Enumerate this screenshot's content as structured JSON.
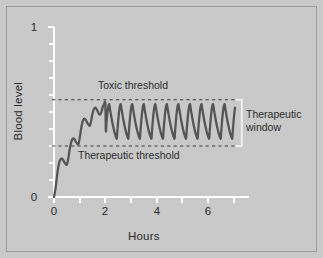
{
  "chart_data": {
    "type": "line",
    "title": "",
    "xlabel": "Hours",
    "ylabel": "Blood level",
    "xlim": [
      0,
      7.6
    ],
    "ylim": [
      0,
      1
    ],
    "grid": false,
    "legend": "none",
    "x_ticks": [
      0,
      1,
      2,
      3,
      4,
      5,
      6,
      7
    ],
    "x_tick_labels": [
      "0",
      "",
      "2",
      "",
      "4",
      "",
      "6",
      ""
    ],
    "y_ticks": [
      0,
      0.1,
      0.2,
      0.3,
      0.4,
      0.5,
      0.6,
      0.7,
      0.8,
      0.9,
      1
    ],
    "y_tick_labels": [
      "0",
      "",
      "",
      "",
      "",
      "",
      "",
      "",
      "",
      "",
      "1"
    ],
    "annotations": [
      {
        "text": "Toxic threshold",
        "x": 1.7,
        "y": 0.69
      },
      {
        "text": "Therapeutic threshold",
        "x": 1.0,
        "y": 0.255
      },
      {
        "text": "Therapeutic window",
        "x": 7.6,
        "y": 0.43
      }
    ],
    "reference_lines": [
      {
        "name": "toxic_threshold",
        "y": 0.572,
        "style": "dashed",
        "color": "#3a3a3a"
      },
      {
        "name": "therapeutic_threshold",
        "y": 0.3,
        "style": "dashed",
        "color": "#3a3a3a"
      }
    ],
    "series": [
      {
        "name": "blood level",
        "color": "#555555",
        "description": "Drug concentration rising to steady state then oscillating between therapeutic and toxic thresholds with repeated dosing",
        "x": [
          0.0,
          0.05,
          0.1,
          0.15,
          0.2,
          0.25,
          0.3,
          0.35,
          0.4,
          0.45,
          0.5,
          0.55,
          0.6,
          0.65,
          0.7,
          0.75,
          0.8,
          0.85,
          0.9,
          0.95,
          1.0,
          1.05,
          1.1,
          1.15,
          1.2,
          1.25,
          1.3,
          1.35,
          1.4,
          1.45,
          1.5,
          1.55,
          1.6,
          1.65,
          1.7,
          1.75,
          1.8,
          1.85,
          1.9,
          1.95,
          2.0
        ],
        "y": [
          0.0,
          0.04,
          0.1,
          0.16,
          0.2,
          0.22,
          0.225,
          0.22,
          0.205,
          0.195,
          0.19,
          0.22,
          0.27,
          0.31,
          0.335,
          0.345,
          0.34,
          0.325,
          0.315,
          0.31,
          0.345,
          0.395,
          0.435,
          0.455,
          0.46,
          0.45,
          0.435,
          0.425,
          0.42,
          0.45,
          0.49,
          0.515,
          0.525,
          0.52,
          0.505,
          0.49,
          0.485,
          0.5,
          0.53,
          0.545,
          0.55
        ]
      }
    ],
    "steady_state": {
      "peak": 0.545,
      "trough": 0.345,
      "dose_interval_hours": 0.45,
      "n_oscillations": 13,
      "end_x": 7.05
    }
  },
  "labels": {
    "y_axis": "Blood level",
    "x_axis": "Hours",
    "y_max": "1",
    "y_min": "0",
    "x_0": "0",
    "x_2": "2",
    "x_4": "4",
    "x_6": "6",
    "toxic_threshold": "Toxic threshold",
    "therapeutic_threshold": "Therapeutic threshold",
    "therapeutic_window_line1": "Therapeutic",
    "therapeutic_window_line2": "window"
  },
  "colors": {
    "background": "#c9c9c9",
    "frame": "#9a9a9a",
    "axis": "#ffffff",
    "curve": "#555555",
    "dashed": "#3a3a3a",
    "text": "#2b2b2b",
    "bracket": "#f2f2f2"
  }
}
